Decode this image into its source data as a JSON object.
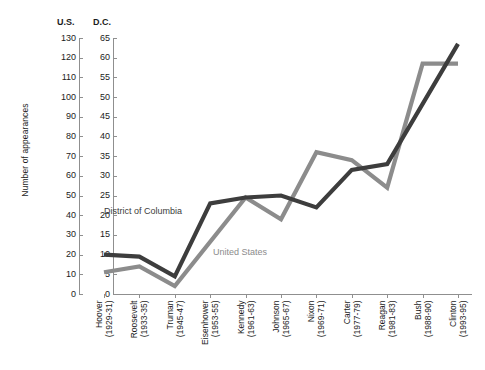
{
  "axes": {
    "left_head": "U.S.",
    "right_head": "D.C.",
    "y_title": "Number of appearances",
    "us_ticks": [
      "130",
      "120",
      "110",
      "100",
      "90",
      "80",
      "70",
      "60",
      "50",
      "40",
      "30",
      "20",
      "10",
      "0"
    ],
    "dc_ticks": [
      "65",
      "60",
      "55",
      "50",
      "45",
      "40",
      "35",
      "30",
      "25",
      "20",
      "15",
      "10",
      "5",
      "0"
    ]
  },
  "series_labels": {
    "dc": "District of Columbia",
    "us": "United States"
  },
  "colors": {
    "dc_line": "#3d3d3d",
    "us_line": "#8c8c8c",
    "axis": "#8f8f8f",
    "text": "#1c1c1c",
    "background": "#ffffff"
  },
  "categories_display": [
    {
      "name": "Hoover",
      "years": "(1929-31)"
    },
    {
      "name": "Roosevelt",
      "years": "(1933-35)"
    },
    {
      "name": "Truman",
      "years": "(1945-47)"
    },
    {
      "name": "Eisenhower",
      "years": "(1953-55)"
    },
    {
      "name": "Kennedy",
      "years": "(1961-63)"
    },
    {
      "name": "Johnson",
      "years": "(1965-67)"
    },
    {
      "name": "Nixon",
      "years": "(1969-71)"
    },
    {
      "name": "Carter",
      "years": "(1977-79)"
    },
    {
      "name": "Reagan",
      "years": "(1981-83)"
    },
    {
      "name": "Bush",
      "years": "(1988-90)"
    },
    {
      "name": "Clinton",
      "years": "(1993-95)"
    }
  ],
  "chart_data": {
    "type": "line",
    "title": "",
    "xlabel": "",
    "ylabel": "Number of appearances",
    "grid": false,
    "legend": "inline-annotation",
    "categories": [
      "Hoover (1929-31)",
      "Roosevelt (1933-35)",
      "Truman (1945-47)",
      "Eisenhower (1953-55)",
      "Kennedy (1961-63)",
      "Johnson (1965-67)",
      "Nixon (1969-71)",
      "Carter (1977-79)",
      "Reagan (1981-83)",
      "Bush (1988-90)",
      "Clinton (1993-95)"
    ],
    "axis_left": {
      "name": "U.S.",
      "ylim": [
        0,
        130
      ],
      "tick_step": 10,
      "series": "United States"
    },
    "axis_right": {
      "name": "D.C.",
      "ylim": [
        0,
        65
      ],
      "tick_step": 5,
      "series": "District of Columbia"
    },
    "series": [
      {
        "name": "District of Columbia",
        "axis": "right",
        "color": "#3d3d3d",
        "values": [
          10,
          9.5,
          4.5,
          23,
          24.5,
          25,
          22,
          31.5,
          33,
          null,
          63.5
        ],
        "note": "No vertex rendered at Bush; line runs straight from Reagan to Clinton"
      },
      {
        "name": "United States",
        "axis": "left",
        "color": "#8c8c8c",
        "values_dc_scale": [
          5.5,
          7,
          2,
          null,
          24.5,
          19,
          36,
          34,
          27,
          58.5,
          58.5
        ],
        "values": [
          11,
          14,
          4,
          null,
          49,
          38,
          72,
          68,
          54,
          117,
          117
        ],
        "note": "No vertex rendered at Eisenhower; line runs straight from Truman to Kennedy"
      }
    ]
  }
}
